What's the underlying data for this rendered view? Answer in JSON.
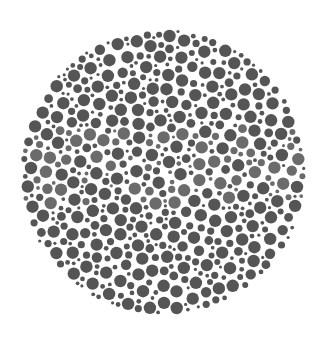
{
  "image": {
    "description": "Ishihara-style color vision test plate rendered in grayscale: a circular field of randomly sized dots",
    "background_color": "#ffffff",
    "plate": {
      "center_x": 163,
      "center_y": 172,
      "radius": 143,
      "dot_color_dark": "#555555",
      "dot_color_light": "#6b6b6b",
      "light_band_y_range": [
        128,
        205
      ],
      "dot_radius_min": 1.6,
      "dot_radius_max": 6.2
    }
  }
}
